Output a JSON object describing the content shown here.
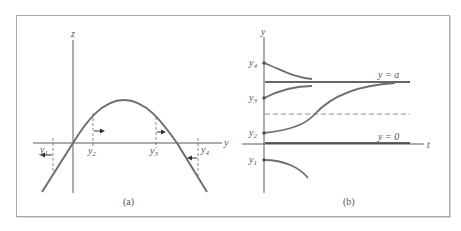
{
  "figure": {
    "panels": [
      {
        "id": "a",
        "caption": "(a)",
        "axes": {
          "vertical_label": "z",
          "horizontal_label": "y"
        },
        "curve": "hump-shaped z(y) crossing zero at y=0 and y=a",
        "points": [
          {
            "label": "y",
            "sub": "1",
            "arrow": "left"
          },
          {
            "label": "y",
            "sub": "2",
            "arrow": "right"
          },
          {
            "label": "y",
            "sub": "3",
            "arrow": "right"
          },
          {
            "label": "y",
            "sub": "4",
            "arrow": "left"
          }
        ]
      },
      {
        "id": "b",
        "caption": "(b)",
        "axes": {
          "vertical_label": "y",
          "horizontal_label": "t"
        },
        "lines": [
          {
            "label": "y = a",
            "style": "solid"
          },
          {
            "label": "y = 0",
            "style": "solid"
          },
          {
            "label": "",
            "style": "dashed"
          }
        ],
        "initial_values": [
          {
            "label": "y",
            "sub": "4"
          },
          {
            "label": "y",
            "sub": "3"
          },
          {
            "label": "y",
            "sub": "2"
          },
          {
            "label": "y",
            "sub": "1"
          }
        ]
      }
    ],
    "colors": {
      "line": "#5a5a5a",
      "curve": "#6e6e6e",
      "frame": "#a9a9a9",
      "text": "#555555"
    }
  }
}
